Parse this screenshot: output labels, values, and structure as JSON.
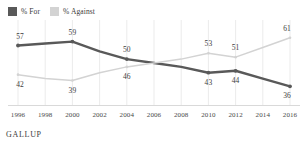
{
  "legend": {
    "items": [
      {
        "label": "% For",
        "color": "#595959",
        "icon": "square-swatch-icon"
      },
      {
        "label": "% Against",
        "color": "#d3d3d3",
        "icon": "square-swatch-icon"
      }
    ]
  },
  "source": {
    "text": "GALLUP"
  },
  "chart_data": {
    "type": "line",
    "title": "",
    "subtitle": "",
    "xlabel": "",
    "ylabel": "",
    "grid": "vertical",
    "legend_position": "top-left",
    "x": [
      1996,
      1998,
      2000,
      2002,
      2004,
      2006,
      2008,
      2010,
      2012,
      2014,
      2016
    ],
    "tick_labels": [
      "1996",
      "1998",
      "2000",
      "2002",
      "2004",
      "2006",
      "2008",
      "2010",
      "2012",
      "2014",
      "2016"
    ],
    "xlim": [
      1996,
      2016
    ],
    "ylim": [
      30,
      66
    ],
    "series": [
      {
        "name": "% For",
        "color": "#595959",
        "values": [
          57,
          58,
          59,
          54,
          50,
          48,
          46,
          43,
          44,
          40,
          36
        ],
        "labeled_points": [
          {
            "x": 1996,
            "y": 57,
            "text": "57",
            "pos": "above"
          },
          {
            "x": 2000,
            "y": 59,
            "text": "59",
            "pos": "above"
          },
          {
            "x": 2004,
            "y": 50,
            "text": "50",
            "pos": "above"
          },
          {
            "x": 2010,
            "y": 43,
            "text": "43",
            "pos": "below"
          },
          {
            "x": 2012,
            "y": 44,
            "text": "44",
            "pos": "below"
          },
          {
            "x": 2016,
            "y": 36,
            "text": "36",
            "pos": "below"
          }
        ]
      },
      {
        "name": "% Against",
        "color": "#d3d3d3",
        "values": [
          42,
          40,
          39,
          43,
          46,
          48,
          50,
          53,
          51,
          56,
          61
        ],
        "labeled_points": [
          {
            "x": 1996,
            "y": 42,
            "text": "42",
            "pos": "below"
          },
          {
            "x": 2000,
            "y": 39,
            "text": "39",
            "pos": "below"
          },
          {
            "x": 2004,
            "y": 46,
            "text": "46",
            "pos": "below"
          },
          {
            "x": 2010,
            "y": 53,
            "text": "53",
            "pos": "above"
          },
          {
            "x": 2012,
            "y": 51,
            "text": "51",
            "pos": "above"
          },
          {
            "x": 2016,
            "y": 61,
            "text": "61",
            "pos": "above"
          }
        ]
      }
    ]
  }
}
